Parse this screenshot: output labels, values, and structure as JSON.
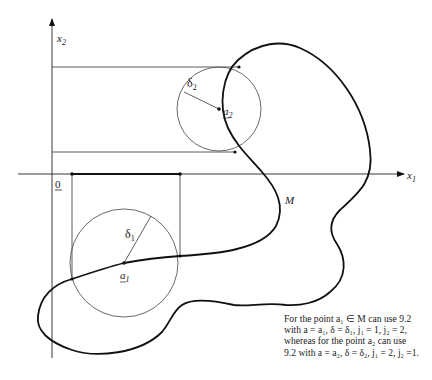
{
  "figure": {
    "axis_labels": {
      "x_axis": "x",
      "x_axis_sub": "1",
      "y_axis": "x",
      "y_axis_sub": "2",
      "origin": "0"
    },
    "set_label": "M",
    "points": [
      {
        "name": "a",
        "sub": "1",
        "radius_label": "δ",
        "radius_sub": "1"
      },
      {
        "name": "a",
        "sub": "2",
        "radius_label": "δ",
        "radius_sub": "2"
      }
    ],
    "caption_lines": [
      "For the point a₁ ∈ M can use 9.2",
      "with a = a₁, δ = δ₁, j₁ = 1, j₂ = 2,",
      "whereas for the point a₂ can use",
      "9.2 with a = a₂, δ = δ₂, j₁ = 2, j₂ =1."
    ]
  }
}
